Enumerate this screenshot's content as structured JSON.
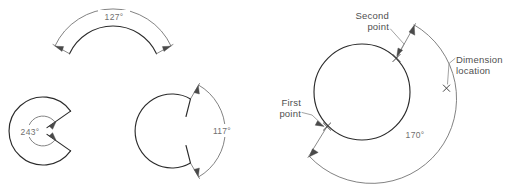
{
  "figure": {
    "background_color": "#ffffff",
    "object_line_color": "#2b2b2b",
    "dimension_line_color": "#6b6b6b",
    "text_color": "#5f5f5f"
  },
  "left_panel": {
    "name": "angular-dimension-examples",
    "items": [
      {
        "id": "arc-127",
        "label": "127°",
        "value": 127,
        "unit": "degrees",
        "shape": "arc",
        "description": "Angular dimension on an arc, dimension arc placed outside above the arc"
      },
      {
        "id": "arc-243",
        "label": "243°",
        "value": 243,
        "unit": "degrees",
        "shape": "major-arc-c-shape",
        "description": "Reflex angular dimension measured inside a C shaped arc"
      },
      {
        "id": "arc-117",
        "label": "117°",
        "value": 117,
        "unit": "degrees",
        "shape": "near-full-circle-with-gap",
        "description": "Angular dimension across the gap of a nearly closed arc"
      }
    ]
  },
  "right_panel": {
    "name": "circle-angular-dimension-diagram",
    "dimension": {
      "id": "arc-170",
      "label": "170°",
      "value": 170,
      "unit": "degrees"
    },
    "callouts": [
      {
        "id": "second-point",
        "line1": "Second",
        "line2": "point",
        "align": "right"
      },
      {
        "id": "dimension-location",
        "line1": "Dimension",
        "line2": "location",
        "align": "left"
      },
      {
        "id": "first-point",
        "line1": "First",
        "line2": "point",
        "align": "right"
      }
    ]
  }
}
